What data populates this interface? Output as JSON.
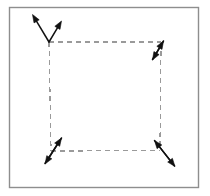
{
  "figure": {
    "canvas": {
      "width": 210,
      "height": 196,
      "background": "#ffffff"
    },
    "frame": {
      "name": "outer-border-frame",
      "x": 9.5,
      "y": 7.5,
      "width": 189,
      "height": 180,
      "stroke": "#8e8e8e",
      "stroke_width": 1.4,
      "fill": "#ffffff"
    },
    "dashed_square": {
      "name": "dashed-square",
      "stroke": "#9a9a9a",
      "stroke_width": 1.3,
      "dash_pattern": "5 4",
      "corners": {
        "top_left": {
          "x": 49,
          "y": 42
        },
        "top_right": {
          "x": 161,
          "y": 42
        },
        "bottom_right": {
          "x": 160,
          "y": 150.5
        },
        "bottom_left": {
          "x": 51,
          "y": 151
        }
      },
      "edges": [
        {
          "name": "edge-top",
          "from": "top_left",
          "to": "top_right"
        },
        {
          "name": "edge-right",
          "from": "top_right",
          "to": "bottom_right"
        },
        {
          "name": "edge-bottom",
          "from": "bottom_left",
          "to": "bottom_right"
        },
        {
          "name": "edge-left",
          "from": "top_left",
          "to": "bottom_left"
        }
      ]
    },
    "arrow_style": {
      "stroke": "#111111",
      "stroke_width": 1.5,
      "head_length": 8,
      "head_width": 6,
      "fill": "#111111"
    },
    "arrows": [
      {
        "name": "arrow-top-left-up-left",
        "corner": "top_left",
        "tail_x": 49,
        "tail_y": 42,
        "tip_x": 32.5,
        "tip_y": 14.5,
        "direction": "up-left"
      },
      {
        "name": "arrow-top-left-up-right",
        "corner": "top_left",
        "tail_x": 49,
        "tail_y": 42,
        "tip_x": 61.5,
        "tip_y": 21.0,
        "direction": "up-right"
      },
      {
        "name": "arrow-top-right-up-right",
        "corner": "top_right",
        "tail_x": 152.5,
        "tail_y": 59.5,
        "tip_x": 163.5,
        "tip_y": 41.0,
        "direction": "up-right"
      },
      {
        "name": "arrow-top-right-down-left",
        "corner": "top_right",
        "tail_x": 163.5,
        "tail_y": 41.0,
        "tip_x": 152.5,
        "tip_y": 60.0,
        "direction": "down-left"
      },
      {
        "name": "arrow-bottom-left-up-right",
        "corner": "bottom_left",
        "tail_x": 45.0,
        "tail_y": 163.5,
        "tip_x": 61.5,
        "tip_y": 138.0,
        "direction": "up-right"
      },
      {
        "name": "arrow-bottom-left-down-left",
        "corner": "bottom_left",
        "tail_x": 61.5,
        "tail_y": 138.0,
        "tip_x": 45.0,
        "tip_y": 164.0,
        "direction": "down-left"
      },
      {
        "name": "arrow-bottom-right-up-left",
        "corner": "bottom_right",
        "tail_x": 174.5,
        "tail_y": 166.0,
        "tip_x": 154.5,
        "tip_y": 140.5,
        "direction": "up-left"
      },
      {
        "name": "arrow-bottom-right-down-right",
        "corner": "bottom_right",
        "tail_x": 154.5,
        "tail_y": 140.5,
        "tip_x": 175.0,
        "tip_y": 166.5,
        "direction": "down-right"
      }
    ]
  }
}
